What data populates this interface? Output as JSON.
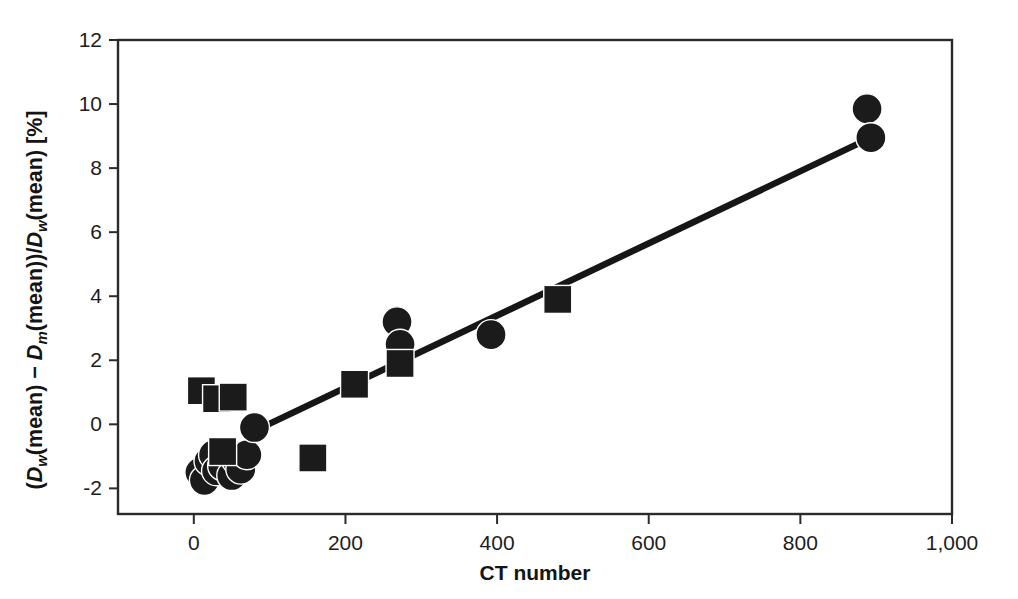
{
  "chart_data": {
    "type": "scatter",
    "title": "",
    "xlabel": "CT number",
    "ylabel": "(Dw(mean) − Dm(mean))/Dw(mean) [%]",
    "ylabel_parts": {
      "open_paren": "(",
      "d_w_1": "D",
      "sub_w_1": "w",
      "mean_1": "(mean)",
      "minus": " − ",
      "d_m": "D",
      "sub_m": "m",
      "mean_2": "(mean))",
      "slash": "/",
      "d_w_2": "D",
      "sub_w_2": "w",
      "mean_3": "(mean)",
      "units": " [%]"
    },
    "xlim": [
      -100,
      1000
    ],
    "ylim": [
      -2.8,
      12
    ],
    "xticks": [
      0,
      200,
      400,
      600,
      800,
      1000
    ],
    "xtick_labels": [
      "0",
      "200",
      "400",
      "600",
      "800",
      "1,000"
    ],
    "yticks": [
      -2,
      0,
      2,
      4,
      6,
      8,
      10,
      12
    ],
    "ytick_labels": [
      "-2",
      "0",
      "2",
      "4",
      "6",
      "8",
      "10",
      "12"
    ],
    "grid": false,
    "legend": false,
    "marker_color": "#1b1b1b",
    "line_color": "#161616",
    "frame_color": "#2b2b2b",
    "series": [
      {
        "name": "circles",
        "marker": "circle",
        "marker_size_px": 30,
        "points": [
          {
            "x": 8,
            "y": -1.5
          },
          {
            "x": 14,
            "y": -1.75
          },
          {
            "x": 20,
            "y": -1.15
          },
          {
            "x": 26,
            "y": -0.95
          },
          {
            "x": 30,
            "y": -1.45
          },
          {
            "x": 38,
            "y": -1.3
          },
          {
            "x": 44,
            "y": -0.85
          },
          {
            "x": 50,
            "y": -1.6
          },
          {
            "x": 56,
            "y": -1.1
          },
          {
            "x": 62,
            "y": -1.4
          },
          {
            "x": 70,
            "y": -0.95
          },
          {
            "x": 80,
            "y": -0.1
          },
          {
            "x": 268,
            "y": 3.2
          },
          {
            "x": 272,
            "y": 2.5
          },
          {
            "x": 392,
            "y": 2.8
          },
          {
            "x": 888,
            "y": 9.85
          },
          {
            "x": 893,
            "y": 8.95
          }
        ]
      },
      {
        "name": "squares",
        "marker": "square",
        "marker_size_px": 28,
        "points": [
          {
            "x": 10,
            "y": 1.05
          },
          {
            "x": 30,
            "y": 0.8
          },
          {
            "x": 52,
            "y": 0.85
          },
          {
            "x": 38,
            "y": -0.85
          },
          {
            "x": 157,
            "y": -1.05
          },
          {
            "x": 212,
            "y": 1.25
          },
          {
            "x": 272,
            "y": 1.9
          },
          {
            "x": 480,
            "y": 3.9
          }
        ]
      }
    ],
    "fit_line": {
      "name": "regression-line",
      "x_start": 85,
      "y_start": -0.15,
      "x_end": 893,
      "y_end": 8.95
    }
  },
  "axes": {
    "x_axis_name": "x-axis",
    "y_axis_name": "y-axis"
  }
}
